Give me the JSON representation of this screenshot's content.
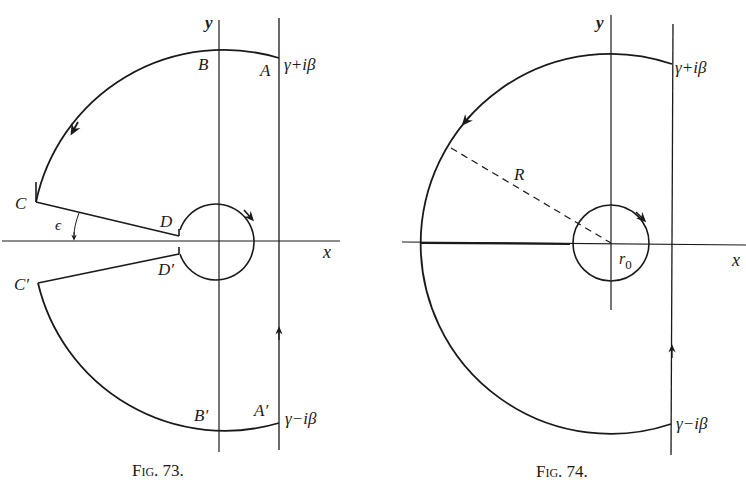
{
  "header_fragment": "(t) ...",
  "figures": [
    {
      "caption": "Fig. 73.",
      "axis_labels": {
        "x": "x",
        "y": "y"
      },
      "points": {
        "A": "A",
        "B": "B",
        "C": "C",
        "D": "D",
        "A_prime": "A′",
        "B_prime": "B′",
        "C_prime": "C′",
        "D_prime": "D′"
      },
      "angle_label": "ϵ",
      "top_label": "γ+iβ",
      "bottom_label": "γ−iβ"
    },
    {
      "caption": "Fig. 74.",
      "axis_labels": {
        "x": "x",
        "y": "y"
      },
      "radius_label": "R",
      "small_radius_label": "r",
      "small_radius_sub": "0",
      "top_label": "γ+iβ",
      "bottom_label": "γ−iβ"
    }
  ],
  "colors": {
    "ink": "#1a1a1a",
    "background": "#ffffff"
  }
}
